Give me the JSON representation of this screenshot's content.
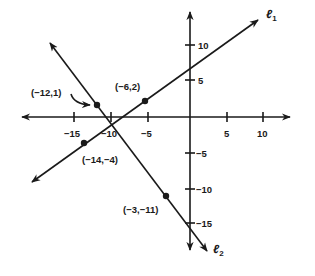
{
  "diagram": {
    "type": "coordinate-plane",
    "axes": {
      "x_ticks": [
        {
          "value": -15,
          "label": "−15"
        },
        {
          "value": -10,
          "label": "−10"
        },
        {
          "value": -5,
          "label": "−5"
        },
        {
          "value": 5,
          "label": "5"
        },
        {
          "value": 10,
          "label": "10"
        }
      ],
      "y_ticks": [
        {
          "value": 10,
          "label": "10"
        },
        {
          "value": 5,
          "label": "5"
        },
        {
          "value": -5,
          "label": "−5"
        },
        {
          "value": -10,
          "label": "−10"
        },
        {
          "value": -15,
          "label": "−15"
        }
      ]
    },
    "lines": [
      {
        "name": "l1",
        "label_main": "ℓ",
        "label_sub": "1",
        "through": [
          [
            -14,
            -4
          ],
          [
            -6,
            2
          ]
        ]
      },
      {
        "name": "l2",
        "label_main": "ℓ",
        "label_sub": "2",
        "through": [
          [
            -12,
            1
          ],
          [
            -3,
            -11
          ]
        ]
      }
    ],
    "points": [
      {
        "x": -12,
        "y": 1,
        "label": "(−12,1)"
      },
      {
        "x": -6,
        "y": 2,
        "label": "(−6,2)"
      },
      {
        "x": -14,
        "y": -4,
        "label": "(−14,−4)"
      },
      {
        "x": -3,
        "y": -11,
        "label": "(−3,−11)"
      }
    ],
    "colors": {
      "ink": "#1a1a1a",
      "background": "#ffffff"
    }
  }
}
